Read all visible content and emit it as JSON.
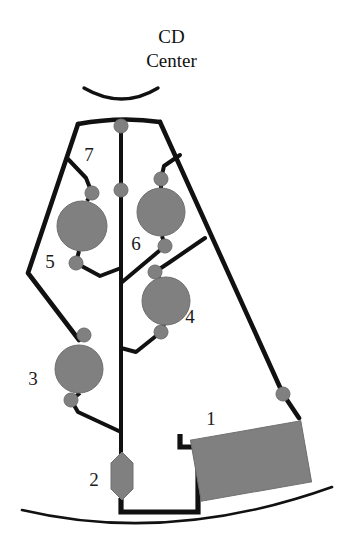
{
  "diagram": {
    "title_line1": "CD",
    "title_line2": "Center",
    "type": "schematic-network",
    "colors": {
      "line": "#111111",
      "node_fill": "#808080",
      "node_stroke": "#5a5a5a",
      "background": "#ffffff",
      "label": "#1a1a1a"
    },
    "labels": [
      {
        "id": "1",
        "text": "1",
        "x": 211,
        "y": 425,
        "shape": "rectangle"
      },
      {
        "id": "2",
        "text": "2",
        "x": 94,
        "y": 486,
        "shape": "hexagon"
      },
      {
        "id": "3",
        "text": "3",
        "x": 33,
        "y": 385,
        "shape": "circle"
      },
      {
        "id": "4",
        "text": "4",
        "x": 190,
        "y": 323,
        "shape": "circle"
      },
      {
        "id": "5",
        "text": "5",
        "x": 50,
        "y": 268,
        "shape": "circle"
      },
      {
        "id": "6",
        "text": "6",
        "x": 136,
        "y": 250,
        "shape": "circle"
      },
      {
        "id": "7",
        "text": "7",
        "x": 89,
        "y": 161,
        "shape": "branch"
      }
    ],
    "nodes": [
      {
        "id": "1",
        "shape": "rectangle",
        "cx": 251,
        "cy": 461,
        "w": 112,
        "h": 62,
        "rotation": -10
      },
      {
        "id": "2",
        "shape": "hexagon",
        "cx": 122,
        "cy": 476,
        "w": 22,
        "h": 44
      },
      {
        "id": "3",
        "shape": "circle",
        "cx": 79,
        "cy": 369,
        "r": 24
      },
      {
        "id": "4",
        "shape": "circle",
        "cx": 166,
        "cy": 301,
        "r": 24
      },
      {
        "id": "5",
        "shape": "circle",
        "cx": 82,
        "cy": 226,
        "r": 25
      },
      {
        "id": "6",
        "shape": "circle",
        "cx": 161,
        "cy": 212,
        "r": 24
      },
      {
        "id": "7",
        "shape": "branch",
        "cx": 92,
        "cy": 161,
        "r": 0
      }
    ],
    "connector_dots": [
      {
        "cx": 121,
        "cy": 126,
        "r": 7
      },
      {
        "cx": 121,
        "cy": 190,
        "r": 7
      },
      {
        "cx": 92,
        "cy": 193,
        "r": 7
      },
      {
        "cx": 76,
        "cy": 263,
        "r": 7
      },
      {
        "cx": 161,
        "cy": 179,
        "r": 7
      },
      {
        "cx": 165,
        "cy": 246,
        "r": 7
      },
      {
        "cx": 155,
        "cy": 272,
        "r": 7
      },
      {
        "cx": 161,
        "cy": 332,
        "r": 7
      },
      {
        "cx": 84,
        "cy": 335,
        "r": 7
      },
      {
        "cx": 71,
        "cy": 400,
        "r": 7
      },
      {
        "cx": 283,
        "cy": 394,
        "r": 7
      }
    ],
    "arcs": {
      "top_arc": "M 84,88 Q 122,110 158,88",
      "bottom_arc": "M 22,510 Q 170,545 330,487"
    }
  }
}
